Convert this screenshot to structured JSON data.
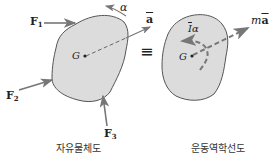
{
  "fbd": {
    "caption": "자유물체도",
    "center_label": "G",
    "forces": [
      {
        "symbol": "F",
        "sub": "1"
      },
      {
        "symbol": "F",
        "sub": "2"
      },
      {
        "symbol": "F",
        "sub": "3"
      }
    ],
    "angular_accel": "α",
    "accel": "a"
  },
  "equiv": "≡",
  "kd": {
    "caption": "운동역학선도",
    "center_label": "G",
    "moment_label": "Iα",
    "moment_bar": "I",
    "moment_alpha": "α",
    "inertia_force": "ma",
    "inertia_m": "m",
    "inertia_a": "a"
  },
  "colors": {
    "body_fill": "#d9d9d9",
    "outline": "#555555",
    "arrow": "#777777",
    "text": "#222222"
  }
}
